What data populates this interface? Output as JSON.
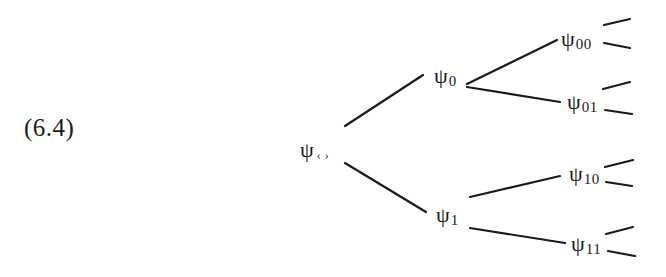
{
  "equation": {
    "number": "(6.4)"
  },
  "tree": {
    "symbol": "ψ",
    "nodes": [
      {
        "id": "root",
        "sub": "‹ ›",
        "x": 300,
        "y": 140
      },
      {
        "id": "0",
        "sub": "0",
        "x": 434,
        "y": 66
      },
      {
        "id": "1",
        "sub": "1",
        "x": 436,
        "y": 205
      },
      {
        "id": "00",
        "sub": "00",
        "x": 560,
        "y": 30
      },
      {
        "id": "01",
        "sub": "01",
        "x": 566,
        "y": 92
      },
      {
        "id": "10",
        "sub": "10",
        "x": 568,
        "y": 165
      },
      {
        "id": "11",
        "sub": "11",
        "x": 570,
        "y": 234
      }
    ],
    "edges": [
      {
        "from": "root",
        "to": "0",
        "x1": 345,
        "y1": 126,
        "x2": 423,
        "y2": 75
      },
      {
        "from": "root",
        "to": "1",
        "x1": 345,
        "y1": 163,
        "x2": 426,
        "y2": 212
      },
      {
        "from": "0",
        "to": "00",
        "x1": 467,
        "y1": 84,
        "x2": 557,
        "y2": 40
      },
      {
        "from": "0",
        "to": "01",
        "x1": 467,
        "y1": 87,
        "x2": 560,
        "y2": 102
      },
      {
        "from": "1",
        "to": "10",
        "x1": 470,
        "y1": 197,
        "x2": 560,
        "y2": 176
      },
      {
        "from": "1",
        "to": "11",
        "x1": 470,
        "y1": 228,
        "x2": 565,
        "y2": 243
      }
    ],
    "stubs": [
      {
        "from": "00",
        "x1": 604,
        "y1": 25,
        "x2": 630,
        "y2": 19
      },
      {
        "from": "00",
        "x1": 604,
        "y1": 43,
        "x2": 630,
        "y2": 48
      },
      {
        "from": "01",
        "x1": 603,
        "y1": 89,
        "x2": 630,
        "y2": 82
      },
      {
        "from": "01",
        "x1": 605,
        "y1": 110,
        "x2": 632,
        "y2": 114
      },
      {
        "from": "10",
        "x1": 605,
        "y1": 167,
        "x2": 633,
        "y2": 160
      },
      {
        "from": "10",
        "x1": 606,
        "y1": 182,
        "x2": 632,
        "y2": 186
      },
      {
        "from": "11",
        "x1": 606,
        "y1": 234,
        "x2": 633,
        "y2": 227
      },
      {
        "from": "11",
        "x1": 608,
        "y1": 251,
        "x2": 635,
        "y2": 256
      }
    ],
    "labels": {
      "root": {
        "symbol": "ψ",
        "sub": "‹ ›"
      },
      "n0": {
        "symbol": "ψ",
        "sub": "0"
      },
      "n1": {
        "symbol": "ψ",
        "sub": "1"
      },
      "n00": {
        "symbol": "ψ",
        "sub": "00"
      },
      "n01": {
        "symbol": "ψ",
        "sub": "01"
      },
      "n10": {
        "symbol": "ψ",
        "sub": "10"
      },
      "n11": {
        "symbol": "ψ",
        "sub": "11"
      }
    }
  }
}
